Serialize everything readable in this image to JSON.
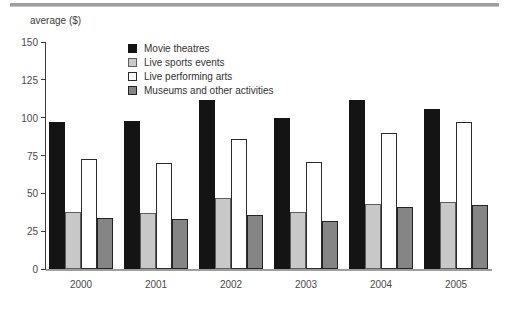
{
  "ylabel": "average ($)",
  "axis": {
    "y_tick_values": [
      0,
      25,
      50,
      75,
      100,
      125,
      150
    ],
    "y_tick_labels": [
      "0",
      "25",
      "50",
      "75",
      "100",
      "125",
      "150"
    ]
  },
  "colors": {
    "movie_theatres": "#141414",
    "movie_theatres_border": "#141414",
    "live_sports": "#c8c8c8",
    "live_sports_border": "#5e5e5e",
    "performing_arts": "#ffffff",
    "performing_arts_border": "#2b2b2b",
    "museums": "#858585",
    "museums_border": "#222222",
    "axis": "#3a3a3a",
    "baseline": "#9e9e9e",
    "top_rule": "#9e9e9e"
  },
  "chart_data": {
    "type": "bar",
    "title": "",
    "xlabel": "",
    "ylabel": "average ($)",
    "categories": [
      "2000",
      "2001",
      "2002",
      "2003",
      "2004",
      "2005"
    ],
    "series": [
      {
        "name": "Movie theatres",
        "color": "#141414",
        "border": "#141414",
        "values": [
          97,
          98,
          112,
          100,
          112,
          106
        ]
      },
      {
        "name": "Live sports events",
        "color": "#c8c8c8",
        "border": "#5e5e5e",
        "values": [
          38,
          37,
          47,
          38,
          43,
          44
        ]
      },
      {
        "name": "Live performing arts",
        "color": "#ffffff",
        "border": "#2b2b2b",
        "values": [
          73,
          70,
          86,
          71,
          90,
          97
        ]
      },
      {
        "name": "Museums and other activities",
        "color": "#858585",
        "border": "#222222",
        "values": [
          34,
          33,
          36,
          32,
          41,
          42
        ]
      }
    ],
    "ylim": [
      0,
      150
    ],
    "y_tick_step": 25,
    "grid": false,
    "legend_position": "top-left-inside",
    "bar_orientation": "vertical"
  }
}
